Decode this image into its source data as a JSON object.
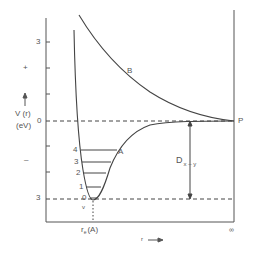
{
  "diagram": {
    "type": "potential-energy-curve",
    "y_axis": {
      "label": "V (r)",
      "unit": "(eV)",
      "ticks": [
        {
          "label": "3",
          "y": 42
        },
        {
          "label": "+",
          "y": 68
        },
        {
          "label": "0",
          "y": 121
        },
        {
          "label": "–",
          "y": 160
        },
        {
          "label": "3",
          "y": 198
        }
      ]
    },
    "x_axis": {
      "label": "r",
      "arrow": "→",
      "re_label": "r",
      "re_sub": "e",
      "re_unit": "(A)",
      "infinity_label": "∞"
    },
    "curves": {
      "bound": {
        "label": "A"
      },
      "repulsive": {
        "label": "B"
      }
    },
    "asymptote_point": {
      "label": "P"
    },
    "dissociation": {
      "label": "D",
      "sub": "x – y"
    },
    "vibrational_levels": {
      "label": "v",
      "levels": [
        "0",
        "1",
        "2",
        "3",
        "4"
      ]
    },
    "colors": {
      "line": "#444444",
      "text": "#555555"
    }
  }
}
